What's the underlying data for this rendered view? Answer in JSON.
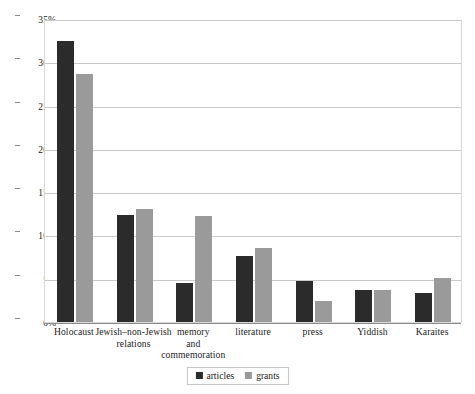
{
  "chart_data": {
    "type": "bar",
    "title": "",
    "subtitle": "",
    "xlabel": "",
    "ylabel": "",
    "ylim": [
      0,
      35
    ],
    "ytick_values": [
      0,
      5,
      10,
      15,
      20,
      25,
      30,
      35
    ],
    "ytick_labels": [
      "0%",
      "5%",
      "10%",
      "15%",
      "20%",
      "25%",
      "30%",
      "35%"
    ],
    "grid": true,
    "legend_position": "bottom-center",
    "value_suffix": "%",
    "categories": [
      "Holocaust",
      "Jewish–non-Jewish relations",
      "memory and commemoration",
      "literature",
      "press",
      "Yiddish",
      "Karaites"
    ],
    "category_lines": [
      [
        "Holocaust"
      ],
      [
        "Jewish–non-Jewish",
        "relations"
      ],
      [
        "memory",
        "and",
        "commemoration"
      ],
      [
        "literature"
      ],
      [
        "press"
      ],
      [
        "Yiddish"
      ],
      [
        "Karaites"
      ]
    ],
    "series": [
      {
        "name": "articles",
        "color": "#2b2b2b",
        "values": [
          32.5,
          12.4,
          4.5,
          7.6,
          4.7,
          3.7,
          3.3
        ]
      },
      {
        "name": "grants",
        "color": "#9a9a9a",
        "values": [
          28.7,
          13.0,
          12.2,
          8.6,
          2.4,
          3.7,
          5.1
        ]
      }
    ]
  },
  "colors": {
    "articles": "#2b2b2b",
    "grants": "#9a9a9a",
    "gridline": "#c9c9c9",
    "axis": "#8a8a8a",
    "frame": "#d8d8d8",
    "background": "#ffffff",
    "text": "#1c1c1c"
  },
  "legend": {
    "items": [
      {
        "label": "articles",
        "series": "articles"
      },
      {
        "label": "grants",
        "series": "grants"
      }
    ]
  }
}
